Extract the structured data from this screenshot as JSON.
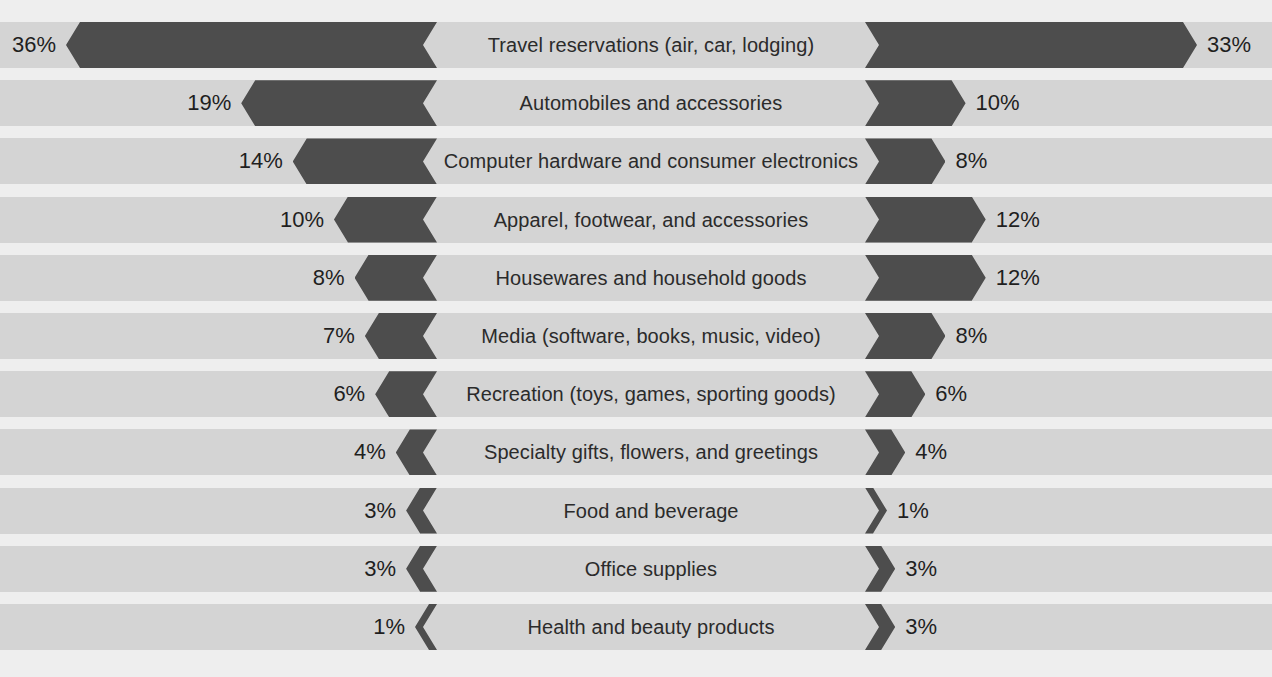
{
  "chart_data": {
    "type": "bar",
    "title": "",
    "subtitle": "",
    "xlabel": "",
    "ylabel": "",
    "orientation": "horizontal",
    "style": "diverging-tornado",
    "grid": false,
    "legend_position": "none",
    "value_suffix": "%",
    "axis_max_percent": 36,
    "categories": [
      "Travel reservations (air, car, lodging)",
      "Automobiles and accessories",
      "Computer hardware and consumer electronics",
      "Apparel, footwear, and accessories",
      "Housewares and household goods",
      "Media (software, books, music, video)",
      "Recreation (toys, games, sporting goods)",
      "Specialty gifts, flowers, and greetings",
      "Food and beverage",
      "Office supplies",
      "Health and beauty products"
    ],
    "series": [
      {
        "name": "left",
        "side": "left",
        "values": [
          36,
          19,
          14,
          10,
          8,
          7,
          6,
          4,
          3,
          3,
          1
        ],
        "labels": [
          "36%",
          "19%",
          "14%",
          "10%",
          "8%",
          "7%",
          "6%",
          "4%",
          "3%",
          "3%",
          "1%"
        ]
      },
      {
        "name": "right",
        "side": "right",
        "values": [
          33,
          10,
          8,
          12,
          12,
          8,
          6,
          4,
          1,
          3,
          3
        ],
        "labels": [
          "33%",
          "10%",
          "8%",
          "12%",
          "12%",
          "8%",
          "6%",
          "4%",
          "1%",
          "3%",
          "3%"
        ]
      }
    ]
  },
  "colors": {
    "background": "#eeeeee",
    "band": "#d4d4d4",
    "bar": "#4d4d4d",
    "text": "#2b2b2b",
    "value_text": "#1f1f1f"
  }
}
